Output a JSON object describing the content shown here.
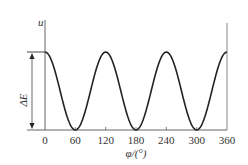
{
  "chart_data": {
    "type": "line",
    "title": "",
    "xlabel": "φ/(°)",
    "ylabel": "u",
    "annotation": "ΔE",
    "xlim": [
      0,
      360
    ],
    "xticks": [
      0,
      60,
      120,
      180,
      240,
      300,
      360
    ],
    "xtick_labels": [
      "0",
      "60",
      "120",
      "180",
      "240",
      "300",
      "360"
    ],
    "grid": false,
    "legend": null,
    "function": "u = ΔE/2 · (1 + cos 3φ)",
    "series": [
      {
        "name": "u(φ)",
        "x": [
          0,
          30,
          60,
          90,
          120,
          150,
          180,
          210,
          240,
          270,
          300,
          330,
          360
        ],
        "values": [
          1,
          0.5,
          0,
          0.5,
          1,
          0.5,
          0,
          0.5,
          1,
          0.5,
          0,
          0.5,
          1
        ]
      }
    ],
    "maxima_at": [
      0,
      120,
      240,
      360
    ],
    "minima_at": [
      60,
      180,
      300
    ]
  },
  "labels": {
    "y_axis": "u",
    "x_axis": "φ/(°)",
    "delta": "ΔE",
    "ticks": [
      "0",
      "60",
      "120",
      "180",
      "240",
      "300",
      "360"
    ]
  }
}
